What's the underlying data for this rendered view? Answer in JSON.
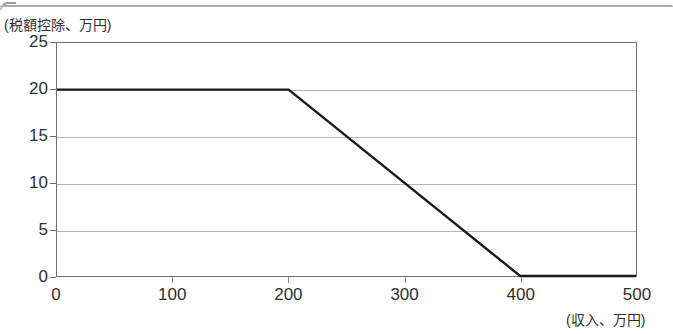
{
  "document": {
    "top_rule": "document-border-rule"
  },
  "chart_data": {
    "type": "line",
    "title": "",
    "xlabel": "(収入、万円)",
    "ylabel": "(税額控除、万円)",
    "xlim": [
      0,
      500
    ],
    "ylim": [
      0,
      25
    ],
    "xticks": [
      0,
      100,
      200,
      300,
      400,
      500
    ],
    "yticks": [
      0,
      5,
      10,
      15,
      20,
      25
    ],
    "xtick_labels": [
      "0",
      "100",
      "200",
      "300",
      "400",
      "500"
    ],
    "ytick_labels": [
      "0",
      "5",
      "10",
      "15",
      "20",
      "25"
    ],
    "grid": "horizontal",
    "legend": "none",
    "series": [
      {
        "name": "税額控除",
        "color": "#1a1a1a",
        "x": [
          0,
          200,
          400,
          500
        ],
        "values": [
          20,
          20,
          0,
          0
        ],
        "points": [
          {
            "x": 0,
            "y": 20
          },
          {
            "x": 200,
            "y": 20
          },
          {
            "x": 400,
            "y": 0
          },
          {
            "x": 500,
            "y": 0
          }
        ]
      }
    ],
    "annotations": []
  },
  "colors": {
    "series_line": "#1a1a1a",
    "gridline": "#b4b4b4",
    "frame": "#6e6e6e",
    "text": "#2f2f2f",
    "background": "#ffffff"
  }
}
